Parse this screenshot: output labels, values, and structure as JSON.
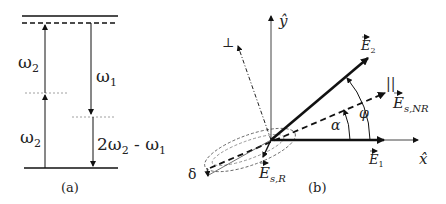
{
  "panel_a": {
    "caption": "(a)",
    "labels": {
      "upper_omega2": "ω",
      "upper_omega2_sub": "2",
      "lower_omega2": "ω",
      "lower_omega2_sub": "2",
      "omega1": "ω",
      "omega1_sub": "1",
      "signal_prefix": "2ω",
      "signal_sub1": "2",
      "signal_mid": " - ω",
      "signal_sub2": "1"
    },
    "levels": [
      "ground state (solid)",
      "virtual level (dashed)",
      "excited state (solid)"
    ]
  },
  "panel_b": {
    "caption": "(b)",
    "axes": {
      "x_label": "x̂",
      "y_label": "ŷ"
    },
    "vectors": {
      "E1": "E",
      "E1_sub": "1",
      "E2": "E",
      "E2_sub": "2",
      "Es_NR": "E",
      "Es_NR_sub": "s,NR",
      "Es_R": "E",
      "Es_R_sub": "s,R"
    },
    "angles": {
      "alpha": "α",
      "phi": "φ"
    },
    "symbols": {
      "parallel": "||",
      "perpendicular": "⊥",
      "delta": "δ"
    }
  },
  "colors": {
    "line": "#111111",
    "dashed": "#333333",
    "dotted": "#888888",
    "background": "#ffffff"
  }
}
